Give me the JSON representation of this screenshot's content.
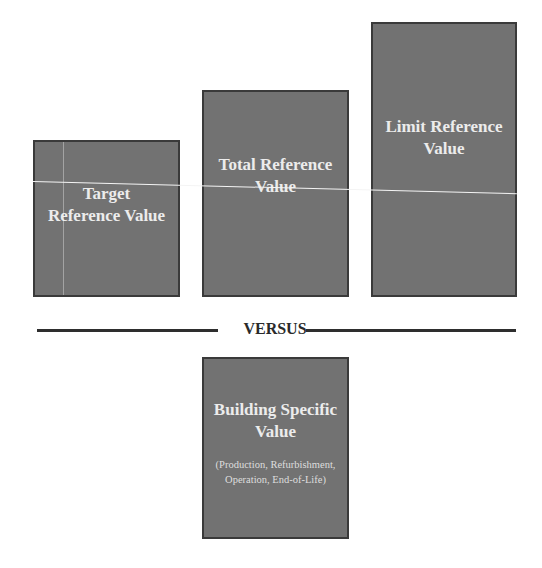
{
  "diagram": {
    "reference_boxes": [
      {
        "id": "target",
        "label": "Target Reference Value"
      },
      {
        "id": "total",
        "label": "Total Reference Value"
      },
      {
        "id": "limit",
        "label": "Limit Reference Value"
      }
    ],
    "divider_label": "VERSUS",
    "building_box": {
      "label": "Building Specific Value",
      "sublabel": "(Production, Refurbishment, Operation, End-of-Life)"
    },
    "colors": {
      "box_fill": "#727272",
      "box_border": "#3a3a3a",
      "box_text": "#ececec",
      "divider": "#2e2e2e",
      "background": "#ffffff"
    }
  }
}
